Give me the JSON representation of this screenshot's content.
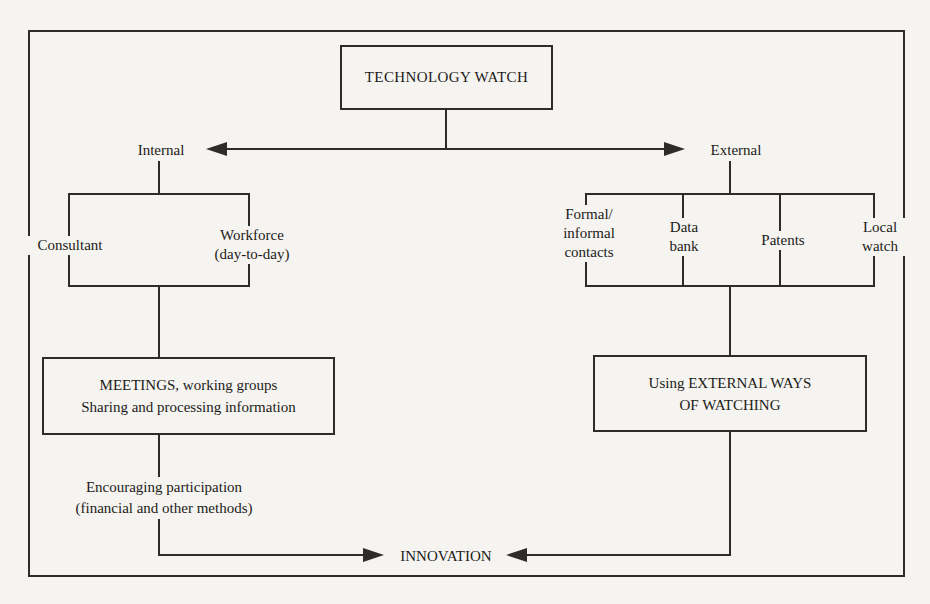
{
  "figure": {
    "title": "TECHNOLOGY WATCH",
    "internal": {
      "label": "Internal",
      "consultant": "Consultant",
      "workforce": [
        "Workforce",
        "(day-to-day)"
      ],
      "process": [
        "MEETINGS, working groups",
        "Sharing and processing information"
      ],
      "note": [
        "Encouraging participation",
        "(financial and other methods)"
      ]
    },
    "external": {
      "label": "External",
      "sources": {
        "formal_informal": [
          "Formal/",
          "informal",
          "contacts"
        ],
        "data_bank": [
          "Data",
          "bank"
        ],
        "patents": [
          "Patents"
        ],
        "local_watch": [
          "Local",
          "watch"
        ]
      },
      "process": [
        "Using EXTERNAL WAYS",
        "OF WATCHING"
      ]
    },
    "outcome": "INNOVATION",
    "colors": {
      "ink": "#2e2c28",
      "paper": "#f5f4f0"
    }
  }
}
